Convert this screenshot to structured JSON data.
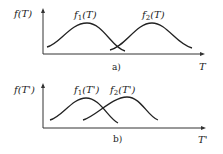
{
  "figures": [
    {
      "caption": "a)",
      "y_label": "f(T)",
      "x_label": "T",
      "curves": [
        {
          "label": "f1(T)",
          "label_main": "f",
          "label_sub": "1",
          "label_arg": "(T)"
        },
        {
          "label": "f2(T)",
          "label_main": "f",
          "label_sub": "2",
          "label_arg": "(T)"
        }
      ]
    },
    {
      "caption": "b)",
      "y_label": "f(T')",
      "x_label": "T'",
      "curves": [
        {
          "label": "f1(T')",
          "label_main": "f",
          "label_sub": "1",
          "label_arg": "(T')"
        },
        {
          "label": "f2(T')",
          "label_main": "f",
          "label_sub": "2",
          "label_arg": "(T')"
        }
      ]
    }
  ]
}
